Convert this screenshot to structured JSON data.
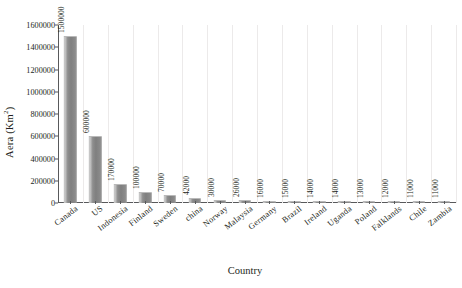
{
  "chart_data": {
    "type": "bar",
    "title": "",
    "subtitle": "",
    "xlabel": "Country",
    "ylabel": "Aera (Km",
    "ylabel_superscript": "2",
    "ylabel_suffix": ")",
    "ylabel_full": "Aera (Km2)",
    "ylim": [
      0,
      1600000
    ],
    "ytick_labels": [
      "0",
      "200000",
      "400000",
      "600000",
      "800000",
      "1000000",
      "1200000",
      "1400000",
      "1600000"
    ],
    "ytick_values": [
      0,
      200000,
      400000,
      600000,
      800000,
      1000000,
      1200000,
      1400000,
      1600000
    ],
    "grid": "vertical-only",
    "legend": "none",
    "bar_color": "#8e8e8e",
    "axis_color": "#58595b",
    "gridline_color": "#eceaea",
    "background": "#ffffff",
    "categories": [
      "Canada",
      "US",
      "Indonesia",
      "Finland",
      "Sweden",
      "china",
      "Norway",
      "Malaysia",
      "Germany",
      "Brazil",
      "Ireland",
      "Uganda",
      "Poland",
      "Falklands",
      "Chile",
      "Zambia"
    ],
    "values": [
      1500000,
      600000,
      170000,
      100000,
      70000,
      42000,
      30000,
      26000,
      16000,
      15000,
      14000,
      14000,
      13000,
      12000,
      11000,
      11000
    ],
    "data_labels": [
      "1500000",
      "600000",
      "170000",
      "100000",
      "70000",
      "42000",
      "30000",
      "26000",
      "16000",
      "15000",
      "14000",
      "14000",
      "13000",
      "12000",
      "11000",
      "11000"
    ]
  }
}
